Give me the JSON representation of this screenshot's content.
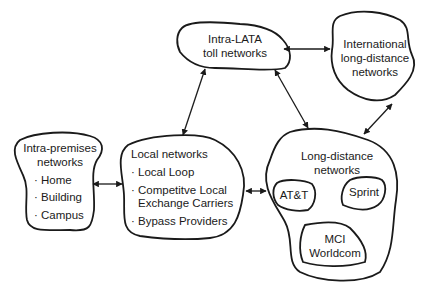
{
  "nodes": {
    "intra_lata": {
      "line1": "Intra-LATA",
      "line2": "toll networks"
    },
    "international": {
      "line1": "International",
      "line2": "long-distance",
      "line3": "networks"
    },
    "intra_premises": {
      "line1": "Intra-premises",
      "line2": "networks",
      "items": [
        "· Home",
        "· Building",
        "· Campus"
      ]
    },
    "local": {
      "title": "Local networks",
      "items": [
        "· Local Loop",
        "· Competitve Local",
        "Exchange Carriers",
        "· Bypass Providers"
      ]
    },
    "long_distance": {
      "line1": "Long-distance",
      "line2": "networks",
      "carriers": [
        "AT&T",
        "Sprint",
        "MCI",
        "Worldcom"
      ]
    }
  },
  "edges": [
    {
      "from": "intra_lata",
      "to": "international",
      "type": "bidirectional"
    },
    {
      "from": "intra_lata",
      "to": "local",
      "type": "bidirectional"
    },
    {
      "from": "intra_lata",
      "to": "long_distance",
      "type": "bidirectional"
    },
    {
      "from": "international",
      "to": "long_distance",
      "type": "bidirectional"
    },
    {
      "from": "intra_premises",
      "to": "local",
      "type": "bidirectional"
    },
    {
      "from": "local",
      "to": "long_distance",
      "type": "bidirectional"
    }
  ],
  "colors": {
    "stroke": "#1a1a1a",
    "background": "#ffffff"
  }
}
